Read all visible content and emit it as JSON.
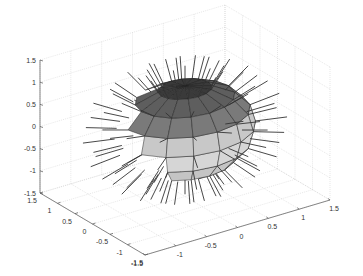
{
  "chart_data": {
    "type": "surface3d",
    "title": "",
    "xlabel": "",
    "ylabel": "",
    "zlabel": "",
    "xlim": [
      -1.5,
      1.5
    ],
    "ylim": [
      -1.5,
      1.5
    ],
    "zlim": [
      -1.5,
      1.5
    ],
    "x_ticks": [
      "-1.5",
      "-1",
      "-0.5",
      "0",
      "0.5",
      "1",
      "1.5"
    ],
    "y_ticks": [
      "1.5",
      "1",
      "0.5",
      "0",
      "-0.5",
      "-1",
      "-1.5"
    ],
    "z_ticks": [
      "1.5",
      "1",
      "0.5",
      "0",
      "-0.5",
      "-1",
      "-1.5"
    ],
    "grid": true,
    "grid_style": "dotted",
    "surface": {
      "shape": "unit sphere",
      "latitude_bands": 8,
      "longitude_segments": 16,
      "band_colors_top_to_bottom": [
        "#3a3a3a",
        "#5e5e5e",
        "#7a7a7a",
        "#c8c8c8",
        "#d6d6d6",
        "#c4c4c4",
        "#a8a8a8",
        "#4a4a4a"
      ],
      "edge_color": "#222222",
      "normals_shown": true,
      "normal_color": "#333333"
    },
    "view": {
      "azimuth": -37.5,
      "elevation": 30
    }
  },
  "axes": {
    "z_tick_labels": [
      "1.5",
      "1",
      "0.5",
      "0",
      "-0.5",
      "-1",
      "-1.5"
    ],
    "left_tick_labels": [
      "1.5",
      "1",
      "0.5",
      "0",
      "-0.5",
      "-1",
      "-1.5"
    ],
    "right_tick_labels": [
      "-1.5",
      "-1",
      "-0.5",
      "0",
      "0.5",
      "1",
      "1.5"
    ]
  }
}
